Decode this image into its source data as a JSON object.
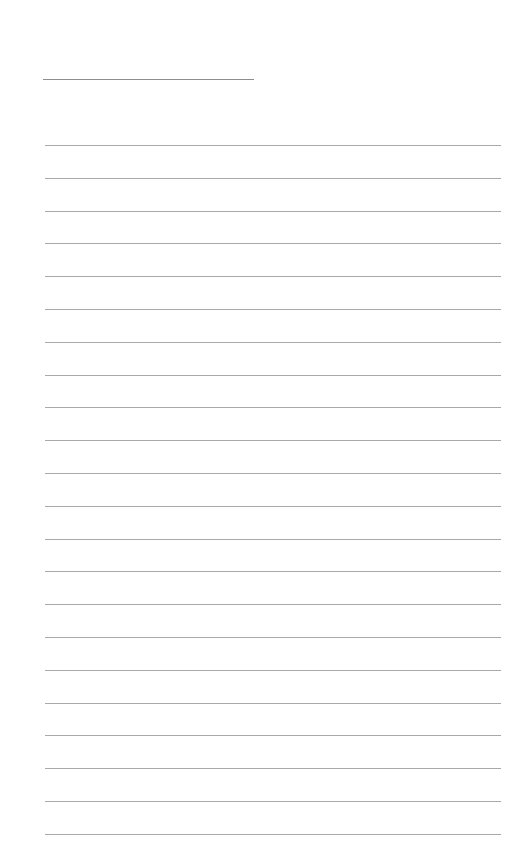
{
  "page": {
    "type": "lined-paper",
    "background_color": "#ffffff",
    "line_color": "#a9a9a9",
    "header_line": {
      "x": 43,
      "y": 79,
      "width": 211
    },
    "ruled_lines": {
      "count": 22,
      "first_y": 145,
      "spacing": 32.8,
      "x": 45,
      "width": 456
    }
  }
}
